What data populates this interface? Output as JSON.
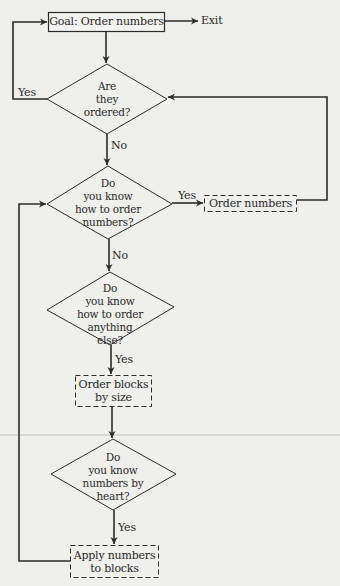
{
  "diagram": {
    "type": "flowchart",
    "nodes": {
      "goal": {
        "shape": "box-solid",
        "label": "Goal: Order numbers"
      },
      "exit": {
        "shape": "terminal-text",
        "label": "Exit"
      },
      "q_ordered": {
        "shape": "diamond",
        "lines": [
          "Are",
          "they",
          "ordered?"
        ]
      },
      "q_know_order_numbers": {
        "shape": "diamond",
        "lines": [
          "Do",
          "you know",
          "how to order",
          "numbers?"
        ]
      },
      "order_numbers": {
        "shape": "box-dashed",
        "label": "Order numbers"
      },
      "q_know_order_else": {
        "shape": "diamond",
        "lines": [
          "Do",
          "you know",
          "how to order",
          "anything",
          "else?"
        ]
      },
      "order_blocks": {
        "shape": "box-dashed",
        "lines": [
          "Order blocks",
          "by size"
        ]
      },
      "q_know_by_heart": {
        "shape": "diamond",
        "lines": [
          "Do",
          "you know",
          "numbers by",
          "heart?"
        ]
      },
      "apply_numbers": {
        "shape": "box-dashed",
        "lines": [
          "Apply numbers",
          "to blocks"
        ]
      }
    },
    "edges": [
      {
        "from": "goal",
        "to": "exit",
        "label": ""
      },
      {
        "from": "goal",
        "to": "q_ordered",
        "label": ""
      },
      {
        "from": "q_ordered",
        "to": "goal",
        "label": "Yes"
      },
      {
        "from": "q_ordered",
        "to": "q_know_order_numbers",
        "label": "No"
      },
      {
        "from": "q_know_order_numbers",
        "to": "order_numbers",
        "label": "Yes"
      },
      {
        "from": "order_numbers",
        "to": "q_ordered",
        "label": ""
      },
      {
        "from": "q_know_order_numbers",
        "to": "q_know_order_else",
        "label": "No"
      },
      {
        "from": "q_know_order_else",
        "to": "order_blocks",
        "label": "Yes"
      },
      {
        "from": "order_blocks",
        "to": "q_know_by_heart",
        "label": ""
      },
      {
        "from": "q_know_by_heart",
        "to": "apply_numbers",
        "label": "Yes"
      },
      {
        "from": "apply_numbers",
        "to": "q_know_order_numbers",
        "label": ""
      }
    ],
    "edge_labels": {
      "yes": "Yes",
      "no": "No"
    },
    "colors": {
      "line": "#2b2b2b",
      "background": "#efefec",
      "text": "#2a2a2a"
    }
  }
}
